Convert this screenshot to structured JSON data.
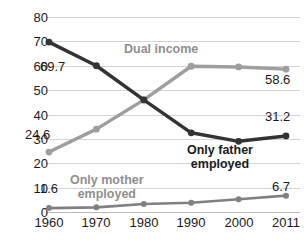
{
  "chart_data": {
    "type": "line",
    "title": "",
    "xlabel": "",
    "ylabel": "",
    "ylim": [
      0,
      80
    ],
    "ytick_values": [
      0,
      10,
      20,
      30,
      40,
      50,
      60,
      70,
      80
    ],
    "grid": true,
    "legend_position": "inline-annotations",
    "categories": [
      "1960",
      "1970",
      "1980",
      "1990",
      "2000",
      "2011"
    ],
    "series": [
      {
        "name": "Only father employed",
        "color": "#333333",
        "values": [
          69.7,
          60.0,
          46.0,
          32.5,
          29.0,
          31.2
        ]
      },
      {
        "name": "Dual income",
        "color": "#9e9e9e",
        "values": [
          24.6,
          34.0,
          46.0,
          59.8,
          59.5,
          58.6
        ]
      },
      {
        "name": "Only mother employed",
        "color": "#808080",
        "values": [
          1.6,
          1.9,
          3.3,
          3.8,
          5.2,
          6.7
        ]
      }
    ],
    "annotations": [
      {
        "text": "Dual income",
        "series": "Dual income"
      },
      {
        "text": "Only father\nemployed",
        "series": "Only father employed"
      },
      {
        "text": "Only mother\nemployed",
        "series": "Only mother employed"
      }
    ],
    "data_labels": [
      {
        "text": "69.7",
        "series": "Only father employed",
        "category": "1960"
      },
      {
        "text": "31.2",
        "series": "Only father employed",
        "category": "2011"
      },
      {
        "text": "24.6",
        "series": "Dual income",
        "category": "1960"
      },
      {
        "text": "58.6",
        "series": "Dual income",
        "category": "2011"
      },
      {
        "text": "1.6",
        "series": "Only mother employed",
        "category": "1960"
      },
      {
        "text": "6.7",
        "series": "Only mother employed",
        "category": "2011"
      }
    ]
  },
  "axis": {
    "y": {
      "t0": "0",
      "t1": "10",
      "t2": "20",
      "t3": "30",
      "t4": "40",
      "t5": "50",
      "t6": "60",
      "t7": "70",
      "t8": "80"
    },
    "x": {
      "t0": "1960",
      "t1": "1970",
      "t2": "1980",
      "t3": "1990",
      "t4": "2000",
      "t5": "2011"
    }
  },
  "annotations": {
    "dual_income": "Dual income",
    "only_father_line1": "Only father",
    "only_father_line2": "employed",
    "only_mother_line1": "Only mother",
    "only_mother_line2": "employed"
  },
  "labels": {
    "father_first": "69.7",
    "father_last": "31.2",
    "dual_first": "24.6",
    "dual_last": "58.6",
    "mother_first": "1.6",
    "mother_last": "6.7"
  }
}
